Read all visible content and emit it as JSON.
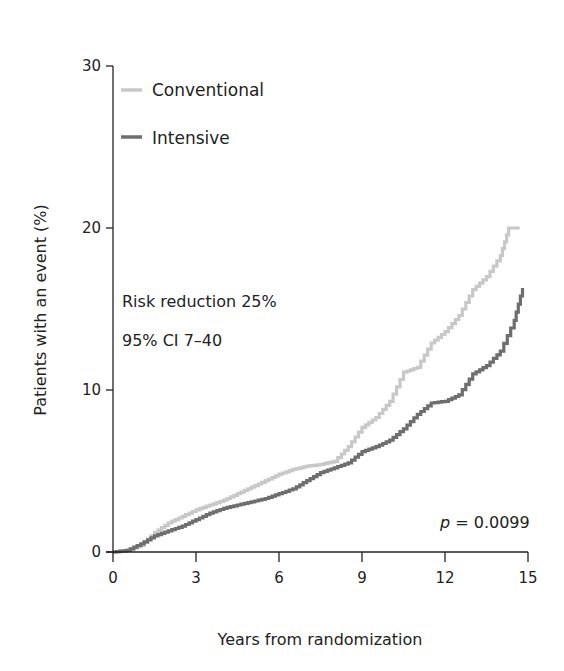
{
  "chart_data": {
    "type": "line",
    "subtype": "kaplan-meier-step",
    "title": "",
    "xlabel": "Years from randomization",
    "ylabel": "Patients with an event (%)",
    "xlim": [
      0,
      15
    ],
    "ylim": [
      0,
      30
    ],
    "xticks": [
      0,
      3,
      6,
      9,
      12,
      15
    ],
    "yticks": [
      0,
      10,
      20,
      30
    ],
    "grid": false,
    "legend_position": "top-left",
    "series": [
      {
        "name": "Conventional",
        "color": "#c8c8c8",
        "x": [
          0,
          0.5,
          1.0,
          1.5,
          2.0,
          2.5,
          3.0,
          3.5,
          4.0,
          4.5,
          5.0,
          5.5,
          6.0,
          6.5,
          7.0,
          7.5,
          8.0,
          8.5,
          9.0,
          9.5,
          10.0,
          10.5,
          11.0,
          11.5,
          12.0,
          12.5,
          13.0,
          13.5,
          14.0,
          14.3,
          14.7
        ],
        "values": [
          0,
          0.1,
          0.4,
          1.2,
          1.8,
          2.2,
          2.6,
          2.9,
          3.2,
          3.6,
          4.0,
          4.4,
          4.8,
          5.1,
          5.3,
          5.4,
          5.6,
          6.5,
          7.7,
          8.3,
          9.3,
          11.1,
          11.4,
          12.9,
          13.6,
          14.6,
          16.2,
          17.0,
          18.3,
          20.0,
          20.0
        ]
      },
      {
        "name": "Intensive",
        "color": "#6e6e6e",
        "x": [
          0,
          0.5,
          1.0,
          1.5,
          2.0,
          2.5,
          3.0,
          3.5,
          4.0,
          4.5,
          5.0,
          5.5,
          6.0,
          6.5,
          7.0,
          7.5,
          8.0,
          8.5,
          9.0,
          9.5,
          10.0,
          10.5,
          11.0,
          11.5,
          12.0,
          12.5,
          13.0,
          13.5,
          14.0,
          14.5,
          14.8
        ],
        "values": [
          0,
          0.1,
          0.5,
          1.0,
          1.3,
          1.6,
          2.0,
          2.4,
          2.7,
          2.9,
          3.1,
          3.3,
          3.6,
          3.9,
          4.4,
          4.9,
          5.2,
          5.5,
          6.2,
          6.5,
          6.9,
          7.6,
          8.5,
          9.2,
          9.3,
          9.7,
          11.0,
          11.5,
          12.4,
          14.3,
          16.3
        ]
      }
    ],
    "annotations": [
      "Risk reduction 25%",
      "95% CI 7–40",
      "p = 0.0099"
    ]
  },
  "legend": {
    "items": [
      {
        "label": "Conventional",
        "color": "#c8c8c8"
      },
      {
        "label": "Intensive",
        "color": "#6e6e6e"
      }
    ]
  },
  "annotations": {
    "risk_reduction": "Risk reduction 25%",
    "ci": "95% CI 7–40",
    "p_symbol": "p",
    "p_value": " = 0.0099"
  },
  "axes": {
    "xlabel": "Years from randomization",
    "ylabel": "Patients with an event (%)",
    "xticks": [
      "0",
      "3",
      "6",
      "9",
      "12",
      "15"
    ],
    "yticks": [
      "0",
      "10",
      "20",
      "30"
    ]
  }
}
